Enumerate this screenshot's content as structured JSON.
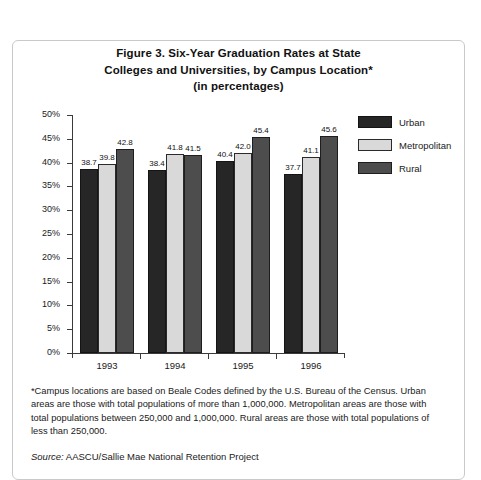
{
  "figure": {
    "title_lines": [
      "Figure 3. Six-Year Graduation Rates at State",
      "Colleges and Universities, by Campus Location*",
      "(in percentages)"
    ],
    "footnote": "*Campus locations are based on Beale Codes defined by the U.S. Bureau of the Census. Urban areas are those with total populations of more than 1,000,000. Metropolitan areas are those with total populations between 250,000 and 1,000,000. Rural areas are those with total populations of less than 250,000.",
    "source_label": "Source:",
    "source_text": " AASCU/Sallie Mae National Retention Project"
  },
  "colors": {
    "urban": "#262626",
    "metropolitan": "#d9d9d9",
    "rural": "#4d4d4d",
    "axis": "#3a3a3a",
    "border": "#c9c9c9",
    "text": "#1a1a1a"
  },
  "chart_data": {
    "type": "bar",
    "title": "Figure 3. Six-Year Graduation Rates at State Colleges and Universities, by Campus Location* (in percentages)",
    "xlabel": "",
    "ylabel": "",
    "categories": [
      "1993",
      "1994",
      "1995",
      "1996"
    ],
    "series": [
      {
        "name": "Urban",
        "values": [
          38.7,
          38.4,
          40.4,
          37.7
        ]
      },
      {
        "name": "Metropolitan",
        "values": [
          39.8,
          41.8,
          42.0,
          41.1
        ]
      },
      {
        "name": "Rural",
        "values": [
          42.8,
          41.5,
          45.4,
          45.6
        ]
      }
    ],
    "ylim": [
      0,
      50
    ],
    "ytick_labels": [
      "50%",
      "45%",
      "40%",
      "35%",
      "30%",
      "25%",
      "20%",
      "15%",
      "10%",
      "5%",
      "0%"
    ],
    "ytick_values": [
      50,
      45,
      40,
      35,
      30,
      25,
      20,
      15,
      10,
      5,
      0
    ],
    "grid": false,
    "legend_position": "right",
    "value_labels": true
  }
}
